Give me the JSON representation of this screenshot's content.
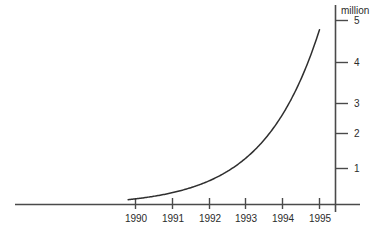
{
  "chart_data": {
    "type": "line",
    "title": "",
    "subtitle": "",
    "xlabel": "",
    "ylabel": "million",
    "unit_label": "million",
    "categories": [
      "1990",
      "1991",
      "1992",
      "1993",
      "1994",
      "1995"
    ],
    "x": [
      1990,
      1991,
      1992,
      1993,
      1994,
      1995
    ],
    "series": [
      {
        "name": "",
        "values": [
          0.18,
          0.38,
          0.62,
          1.05,
          1.95,
          4.75
        ]
      }
    ],
    "x_tick_labels": [
      "1990",
      "1991",
      "1992",
      "1993",
      "1994",
      "1995"
    ],
    "y_tick_labels": [
      "1",
      "2",
      "3",
      "4",
      "5"
    ],
    "y_tick_values": [
      1,
      2,
      3,
      4,
      5
    ],
    "xlim": [
      1989.3,
      1995.45
    ],
    "ylim": [
      0,
      5.4
    ],
    "grid": false,
    "legend": false,
    "legend_position": "none",
    "annotations": []
  },
  "axes": {
    "y_axis_name": "y-axis",
    "x_axis_name": "x-axis",
    "unit_label": "million"
  },
  "colors": {
    "curve": "#2f2f2f",
    "axis": "#4a4a4a",
    "text": "#2b2b2b",
    "background": "#ffffff"
  }
}
